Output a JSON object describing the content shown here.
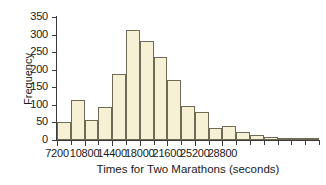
{
  "chart_data": {
    "type": "bar",
    "title": "",
    "xlabel": "Times for Two Marathons (seconds)",
    "ylabel": "Frequency",
    "bin_start": 7200,
    "bin_width": 1800,
    "categories": [
      "7200",
      "9000",
      "10800",
      "12600",
      "14400",
      "16200",
      "18000",
      "19800",
      "21600",
      "23400",
      "25200",
      "27000",
      "28800",
      "30600",
      "32400",
      "34200",
      "36000",
      "37800",
      "39600"
    ],
    "values": [
      50,
      115,
      58,
      95,
      188,
      313,
      283,
      235,
      170,
      97,
      80,
      33,
      39,
      22,
      14,
      8,
      6,
      4,
      2
    ],
    "xlim": [
      7200,
      41400
    ],
    "ylim": [
      0,
      350
    ],
    "ytick_labels": [
      "0",
      "50",
      "100",
      "150",
      "200",
      "250",
      "300",
      "350"
    ],
    "ytick_values": [
      0,
      50,
      100,
      150,
      200,
      250,
      300,
      350
    ],
    "xtick_labels": [
      "7200",
      "10800",
      "14400",
      "18000",
      "21600",
      "25200",
      "28800"
    ],
    "xtick_values": [
      7200,
      10800,
      14400,
      18000,
      21600,
      25200,
      28800
    ],
    "grid": false,
    "legend": false,
    "bar_fill_color": "#f6f1d4",
    "bar_edge_color": "#6e6a55",
    "axis_color": "#3a3a3a",
    "background_color": "#ffffff"
  }
}
